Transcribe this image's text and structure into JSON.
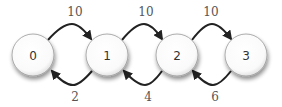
{
  "diagram": {
    "type": "state-transition",
    "nodes": [
      {
        "id": "0",
        "label": "0",
        "cx": 33,
        "cy": 55
      },
      {
        "id": "1",
        "label": "1",
        "cx": 107,
        "cy": 55
      },
      {
        "id": "2",
        "label": "2",
        "cx": 177,
        "cy": 55
      },
      {
        "id": "3",
        "label": "3",
        "cx": 246,
        "cy": 55
      }
    ],
    "forward_edges": [
      {
        "from": "0",
        "to": "1",
        "label": "10"
      },
      {
        "from": "1",
        "to": "2",
        "label": "10"
      },
      {
        "from": "2",
        "to": "3",
        "label": "10"
      }
    ],
    "backward_edges": [
      {
        "from": "1",
        "to": "0",
        "label": "2"
      },
      {
        "from": "2",
        "to": "1",
        "label": "4"
      },
      {
        "from": "3",
        "to": "2",
        "label": "6"
      }
    ],
    "colors": {
      "node_fill": "#ffffff",
      "node_stroke": "#888888",
      "edge": "#222222",
      "text": "#333333"
    }
  }
}
